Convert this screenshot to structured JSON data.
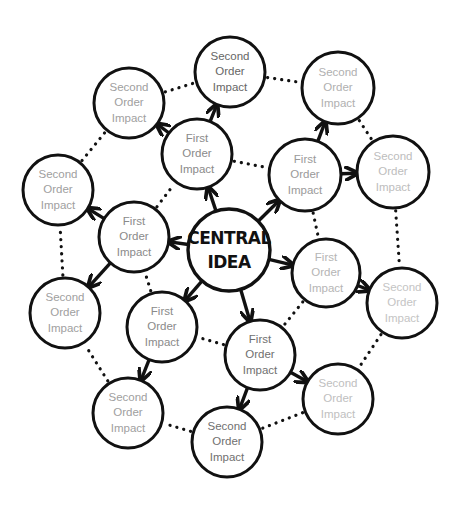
{
  "diagram": {
    "central": {
      "id": "central",
      "lines": [
        "CENTRAL",
        "IDEA"
      ],
      "cx": 229,
      "cy": 250,
      "r": 41
    },
    "first_order": [
      {
        "id": "f-upper-left",
        "lines": [
          "First",
          "Order",
          "Impact"
        ],
        "cx": 197,
        "cy": 154,
        "r": 35,
        "text_color": "#8a8a8a"
      },
      {
        "id": "f-upper-right",
        "lines": [
          "First",
          "Order",
          "Impact"
        ],
        "cx": 305,
        "cy": 175,
        "r": 36,
        "text_color": "#9a9a9a"
      },
      {
        "id": "f-left",
        "lines": [
          "First",
          "Order",
          "Impact"
        ],
        "cx": 134,
        "cy": 237,
        "r": 35,
        "text_color": "#8a8a8a"
      },
      {
        "id": "f-right",
        "lines": [
          "First",
          "Order",
          "Impact"
        ],
        "cx": 326,
        "cy": 273,
        "r": 34,
        "text_color": "#b5b5b5"
      },
      {
        "id": "f-lower-left",
        "lines": [
          "First",
          "Order",
          "Impact"
        ],
        "cx": 162,
        "cy": 327,
        "r": 35,
        "text_color": "#8a8a8a"
      },
      {
        "id": "f-bottom",
        "lines": [
          "First",
          "Order",
          "Impact"
        ],
        "cx": 260,
        "cy": 355,
        "r": 35,
        "text_color": "#707070"
      }
    ],
    "second_order": [
      {
        "id": "s-top",
        "lines": [
          "Second",
          "Order",
          "Impact"
        ],
        "cx": 230,
        "cy": 72,
        "r": 35,
        "text_color": "#666666"
      },
      {
        "id": "s-upper-left",
        "lines": [
          "Second",
          "Order",
          "Impact"
        ],
        "cx": 129,
        "cy": 103,
        "r": 35,
        "text_color": "#a0a0a0"
      },
      {
        "id": "s-upper-right",
        "lines": [
          "Second",
          "Order",
          "Impact"
        ],
        "cx": 338,
        "cy": 88,
        "r": 36,
        "text_color": "#b0b0b0"
      },
      {
        "id": "s-left",
        "lines": [
          "Second",
          "Order",
          "Impact"
        ],
        "cx": 58,
        "cy": 190,
        "r": 35,
        "text_color": "#a0a0a0"
      },
      {
        "id": "s-right-upper",
        "lines": [
          "Second",
          "Order",
          "Impact"
        ],
        "cx": 393,
        "cy": 172,
        "r": 36,
        "text_color": "#bdbdbd"
      },
      {
        "id": "s-lower-left",
        "lines": [
          "Second",
          "Order",
          "Impact"
        ],
        "cx": 65,
        "cy": 313,
        "r": 35,
        "text_color": "#a0a0a0"
      },
      {
        "id": "s-right",
        "lines": [
          "Second",
          "Order",
          "Impact"
        ],
        "cx": 402,
        "cy": 303,
        "r": 35,
        "text_color": "#c4c4c4"
      },
      {
        "id": "s-bottom-left",
        "lines": [
          "Second",
          "Order",
          "Impact"
        ],
        "cx": 128,
        "cy": 413,
        "r": 35,
        "text_color": "#a0a0a0"
      },
      {
        "id": "s-bottom-right",
        "lines": [
          "Second",
          "Order",
          "Impact"
        ],
        "cx": 338,
        "cy": 399,
        "r": 35,
        "text_color": "#c0c0c0"
      },
      {
        "id": "s-bottom",
        "lines": [
          "Second",
          "Order",
          "Impact"
        ],
        "cx": 227,
        "cy": 442,
        "r": 35,
        "text_color": "#707070"
      }
    ],
    "arrows": [
      [
        "central",
        "f-upper-left"
      ],
      [
        "central",
        "f-upper-right"
      ],
      [
        "central",
        "f-left"
      ],
      [
        "central",
        "f-right"
      ],
      [
        "central",
        "f-lower-left"
      ],
      [
        "central",
        "f-bottom"
      ],
      [
        "f-upper-left",
        "s-top"
      ],
      [
        "f-upper-left",
        "s-upper-left"
      ],
      [
        "f-upper-right",
        "s-upper-right"
      ],
      [
        "f-upper-right",
        "s-right-upper"
      ],
      [
        "f-left",
        "s-left"
      ],
      [
        "f-left",
        "s-lower-left"
      ],
      [
        "f-right",
        "s-right"
      ],
      [
        "f-lower-left",
        "s-bottom-left"
      ],
      [
        "f-bottom",
        "s-bottom"
      ],
      [
        "f-bottom",
        "s-bottom-right"
      ]
    ],
    "dotted_links": [
      [
        "s-upper-left",
        "s-top"
      ],
      [
        "s-top",
        "s-upper-right"
      ],
      [
        "s-upper-right",
        "s-right-upper"
      ],
      [
        "s-right-upper",
        "s-right"
      ],
      [
        "s-right",
        "s-bottom-right"
      ],
      [
        "s-bottom-right",
        "s-bottom"
      ],
      [
        "s-bottom",
        "s-bottom-left"
      ],
      [
        "s-bottom-left",
        "s-lower-left"
      ],
      [
        "s-lower-left",
        "s-left"
      ],
      [
        "s-left",
        "s-upper-left"
      ],
      [
        "f-upper-left",
        "f-upper-right"
      ],
      [
        "f-upper-right",
        "f-right"
      ],
      [
        "f-right",
        "f-bottom"
      ],
      [
        "f-bottom",
        "f-lower-left"
      ],
      [
        "f-lower-left",
        "f-left"
      ],
      [
        "f-left",
        "f-upper-left"
      ]
    ],
    "colors": {
      "stroke": "#111111",
      "background": "#ffffff",
      "central_text": "#111111"
    }
  }
}
